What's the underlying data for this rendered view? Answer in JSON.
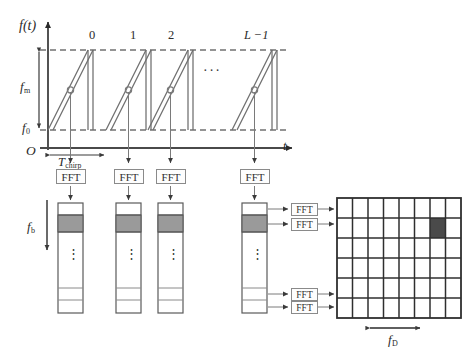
{
  "figure": {
    "kind": "fmcw-radar-2d-fft-diagram",
    "axes": {
      "y_label": "f(t)",
      "x_label": "t",
      "origin_label": "O",
      "bandwidth_label": "f",
      "bandwidth_sub": "m",
      "start_freq_label": "f",
      "start_freq_sub": "0",
      "chirp_period_label": "T",
      "chirp_period_sub": "chirp"
    },
    "chirps": {
      "indices": [
        "0",
        "1",
        "2",
        "L −1"
      ],
      "ellipsis": "···"
    },
    "range_fft": {
      "label": "FFT",
      "count": 4
    },
    "bars": {
      "axis_label": "f",
      "axis_sub": "b",
      "vertical_ellipsis": "⋮",
      "count": 4,
      "highlight_cell_index": 1
    },
    "doppler_fft": {
      "label": "FFT",
      "count": 4
    },
    "grid": {
      "columns": 8,
      "rows": 6,
      "highlight": {
        "row": 2,
        "column": 6
      },
      "axis_label": "f",
      "axis_sub": "D"
    },
    "colors": {
      "line": "#555555",
      "dashed": "#2b2b2b",
      "cell_fill": "#9a9a9a",
      "grid_highlight": "#4a4a4a",
      "grid_line": "#2f2f2f",
      "box_border": "#8a8a8a",
      "background": "#ffffff"
    }
  }
}
